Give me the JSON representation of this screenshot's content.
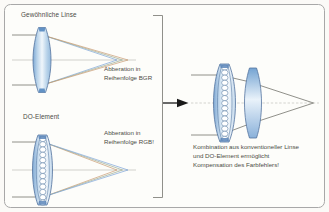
{
  "diagram": {
    "type": "optics-schematic",
    "conventional_panel": {
      "title": "Gewöhnliche Linse",
      "caption": [
        "Abberation in",
        "Reihenfolge BGR"
      ]
    },
    "do_panel": {
      "title": "DO-Element",
      "caption": [
        "Abberation in",
        "Reihenfolge RGB!"
      ]
    },
    "combination_panel": {
      "caption": [
        "Kombination aus konventioneller Linse",
        "und DO-Element ermöglicht",
        "Kompensation des Farbfehlers!"
      ]
    },
    "colors": {
      "ray_blue": "#7ba3d8",
      "ray_green": "#9aab92",
      "ray_red": "#c89a70",
      "ray_gray": "#83837d",
      "axis_gray": "#bdbdb8",
      "lens_stroke": "#54749e",
      "lens_fill_light": "#f0f6fb",
      "lens_fill_edge": "#7fa9d4",
      "frame_border": "#a8a8a8",
      "arrow_black": "#191919",
      "text": "#4c4c45"
    }
  }
}
